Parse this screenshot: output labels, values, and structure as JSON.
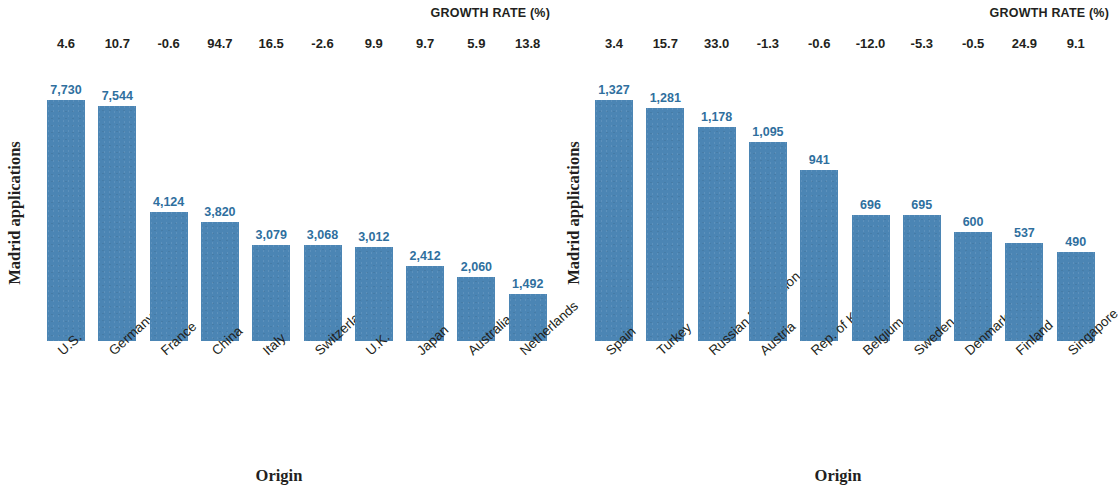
{
  "figure": {
    "accent_color": "#4b85b4",
    "value_label_color": "#2f6f9e",
    "text_color": "#231f20"
  },
  "panels": [
    {
      "id": "left",
      "growth_title": "GROWTH RATE (%)",
      "ylabel": "Madrid applications",
      "xlabel": "Origin"
    },
    {
      "id": "right",
      "growth_title": "GROWTH RATE (%)",
      "ylabel": "Madrid applications",
      "xlabel": "Origin"
    }
  ],
  "chart_data": [
    {
      "type": "bar",
      "title": "",
      "xlabel": "Origin",
      "ylabel": "Madrid applications",
      "grid": false,
      "ylim": [
        0,
        7730
      ],
      "categories": [
        "U.S.",
        "Germany",
        "France",
        "China",
        "Italy",
        "Switzerland",
        "U.K.",
        "Japan",
        "Australia",
        "Netherlands"
      ],
      "values": [
        7730,
        7544,
        4124,
        3820,
        3079,
        3068,
        3012,
        2412,
        2060,
        1492
      ],
      "value_labels": [
        "7,730",
        "7,544",
        "4,124",
        "3,820",
        "3,079",
        "3,068",
        "3,012",
        "2,412",
        "2,060",
        "1,492"
      ],
      "annotations": {
        "name": "GROWTH RATE (%)",
        "values": [
          4.6,
          10.7,
          -0.6,
          94.7,
          16.5,
          -2.6,
          9.9,
          9.7,
          5.9,
          13.8
        ],
        "labels": [
          "4.6",
          "10.7",
          "-0.6",
          "94.7",
          "16.5",
          "-2.6",
          "9.9",
          "9.7",
          "5.9",
          "13.8"
        ]
      }
    },
    {
      "type": "bar",
      "title": "",
      "xlabel": "Origin",
      "ylabel": "Madrid applications",
      "grid": false,
      "ylim": [
        0,
        1327
      ],
      "categories": [
        "Spain",
        "Turkey",
        "Russian Federation",
        "Austria",
        "Rep. of Korea",
        "Belgium",
        "Sweden",
        "Denmark",
        "Finland",
        "Singapore"
      ],
      "values": [
        1327,
        1281,
        1178,
        1095,
        941,
        696,
        695,
        600,
        537,
        490
      ],
      "value_labels": [
        "1,327",
        "1,281",
        "1,178",
        "1,095",
        "941",
        "696",
        "695",
        "600",
        "537",
        "490"
      ],
      "annotations": {
        "name": "GROWTH RATE (%)",
        "values": [
          3.4,
          15.7,
          33.0,
          -1.3,
          -0.6,
          -12.0,
          -5.3,
          -0.5,
          24.9,
          9.1
        ],
        "labels": [
          "3.4",
          "15.7",
          "33.0",
          "-1.3",
          "-0.6",
          "-12.0",
          "-5.3",
          "-0.5",
          "24.9",
          "9.1"
        ]
      }
    }
  ]
}
